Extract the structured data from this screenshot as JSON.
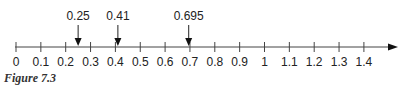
{
  "figure": {
    "caption": "Figure 7.3",
    "axis": {
      "min": 0,
      "max": 1.4,
      "step": 0.1,
      "x0": 16,
      "unit_px": 248.5,
      "y": 47,
      "end_x": 398
    },
    "ticks": [
      "0",
      "0.1",
      "0.2",
      "0.3",
      "0.4",
      "0.5",
      "0.6",
      "0.7",
      "0.8",
      "0.9",
      "1",
      "1.1",
      "1.2",
      "1.3",
      "1.4"
    ],
    "markers": [
      {
        "value": 0.25,
        "label": "0.25"
      },
      {
        "value": 0.41,
        "label": "0.41"
      },
      {
        "value": 0.695,
        "label": "0.695"
      }
    ],
    "colors": {
      "line": "#444444",
      "text": "#222222"
    }
  }
}
